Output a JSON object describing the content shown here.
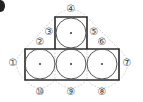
{
  "figure": {
    "badge_icon": "filled-circle-bullet",
    "colors": {
      "outline": "#2a2a2a",
      "circle": "#555555",
      "guide": "#c8c8c8",
      "label": "#444444"
    },
    "shapes": {
      "top_square": {
        "x": 55,
        "y": 17,
        "w": 32,
        "h": 32
      },
      "bottom_rect": {
        "x": 25,
        "y": 49,
        "w": 94,
        "h": 31
      },
      "circles": [
        {
          "cx": 71,
          "cy": 33,
          "r": 15
        },
        {
          "cx": 40,
          "cy": 64,
          "r": 15
        },
        {
          "cx": 71,
          "cy": 64,
          "r": 15
        },
        {
          "cx": 102,
          "cy": 64,
          "r": 15
        }
      ]
    },
    "labels": [
      {
        "id": "1",
        "text": "①",
        "x": 13,
        "y": 66
      },
      {
        "id": "2",
        "text": "②",
        "x": 40,
        "y": 45
      },
      {
        "id": "3",
        "text": "③",
        "x": 49,
        "y": 35
      },
      {
        "id": "4",
        "text": "④",
        "x": 71,
        "y": 12
      },
      {
        "id": "5",
        "text": "⑤",
        "x": 94,
        "y": 35
      },
      {
        "id": "6",
        "text": "⑥",
        "x": 102,
        "y": 45
      },
      {
        "id": "7",
        "text": "⑦",
        "x": 127,
        "y": 66
      },
      {
        "id": "8",
        "text": "⑧",
        "x": 102,
        "y": 95
      },
      {
        "id": "9",
        "text": "⑨",
        "x": 71,
        "y": 95
      },
      {
        "id": "10",
        "text": "⑩",
        "x": 40,
        "y": 95
      }
    ]
  }
}
